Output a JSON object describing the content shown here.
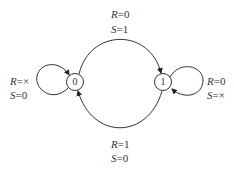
{
  "diagram": {
    "type": "state-transition",
    "states": [
      {
        "id": "0",
        "label": "0"
      },
      {
        "id": "1",
        "label": "1"
      }
    ],
    "transitions": [
      {
        "from": "0",
        "to": "1",
        "R_var": "R",
        "R_val": "=0",
        "S_var": "S",
        "S_val": "=1"
      },
      {
        "from": "1",
        "to": "0",
        "R_var": "R",
        "R_val": "=1",
        "S_var": "S",
        "S_val": "=0"
      },
      {
        "from": "0",
        "to": "0",
        "R_var": "R",
        "R_val": "=×",
        "S_var": "S",
        "S_val": "=0"
      },
      {
        "from": "1",
        "to": "1",
        "R_var": "R",
        "R_val": "=0",
        "S_var": "S",
        "S_val": "=×"
      }
    ],
    "colors": {
      "stroke": "#333333",
      "background": "#ffffff"
    }
  }
}
